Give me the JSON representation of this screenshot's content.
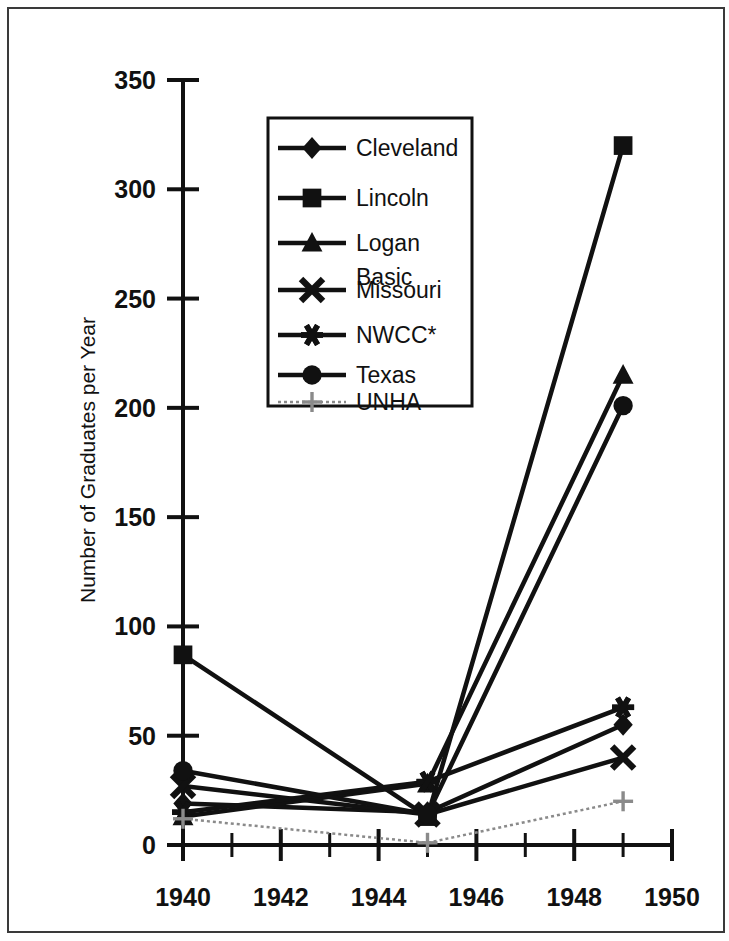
{
  "figure": {
    "background_color": "#ffffff",
    "frame_color": "#3a3a3a",
    "series_color": "#111111",
    "faint_series_color": "#8a8a8a"
  },
  "chart_data": {
    "type": "line",
    "title": "",
    "xlabel": "",
    "ylabel": "Number of Graduates per Year",
    "xlim": [
      1940,
      1950
    ],
    "ylim": [
      0,
      350
    ],
    "xticks": [
      1940,
      1942,
      1944,
      1946,
      1948,
      1950
    ],
    "xtick_labels": [
      "1940",
      "1942",
      "1944",
      "1946",
      "1948",
      "1950"
    ],
    "minor_xticks": [
      1941,
      1943,
      1945,
      1947,
      1949
    ],
    "yticks": [
      0,
      50,
      100,
      150,
      200,
      250,
      300,
      350
    ],
    "ytick_labels": [
      "0",
      "50",
      "100",
      "150",
      "200",
      "250",
      "300",
      "350"
    ],
    "grid": false,
    "legend_position": "upper center",
    "x": [
      1940,
      1945,
      1949
    ],
    "series": [
      {
        "name": "Cleveland",
        "marker": "diamond",
        "linestyle": "solid",
        "values": [
          19,
          15,
          55
        ]
      },
      {
        "name": "Lincoln",
        "marker": "square",
        "linestyle": "solid",
        "values": [
          87,
          13,
          320
        ]
      },
      {
        "name": "Logan Basic",
        "marker": "triangle",
        "linestyle": "solid",
        "values": [
          13,
          28,
          215
        ]
      },
      {
        "name": "Missouri",
        "marker": "x",
        "linestyle": "solid",
        "values": [
          27,
          14,
          40
        ]
      },
      {
        "name": "NWCC*",
        "marker": "asterisk",
        "linestyle": "solid",
        "values": [
          15,
          29,
          63
        ]
      },
      {
        "name": "Texas",
        "marker": "circle",
        "linestyle": "solid",
        "values": [
          34,
          14,
          201
        ]
      },
      {
        "name": "UNHA",
        "marker": "plus",
        "linestyle": "dotted",
        "values": [
          12,
          1,
          20
        ]
      }
    ]
  },
  "legend": {
    "entries": [
      {
        "label": "Cleveland",
        "marker": "diamond"
      },
      {
        "label": "Lincoln",
        "marker": "square"
      },
      {
        "label": "Logan",
        "label2": "Basic",
        "marker": "triangle"
      },
      {
        "label": "Missouri",
        "marker": "x"
      },
      {
        "label": "NWCC*",
        "marker": "asterisk"
      },
      {
        "label": "Texas",
        "marker": "circle"
      },
      {
        "label": "UNHA",
        "marker": "plus"
      }
    ]
  }
}
